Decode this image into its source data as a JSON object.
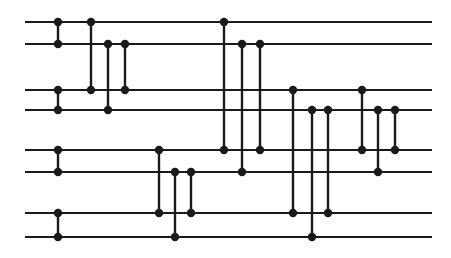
{
  "figure": {
    "type": "comparator-network",
    "width": 451,
    "height": 258,
    "background_color": "#ffffff",
    "ink_color": "#1a1a1a"
  },
  "chart_data": {
    "type": "diagram",
    "xlabel": "",
    "ylabel": "",
    "grid": false,
    "legend": null,
    "wire_count": 8,
    "wire_labels": [
      "1",
      "2",
      "3",
      "4",
      "5",
      "6",
      "7",
      "8"
    ],
    "wire_x_start": 25,
    "wire_x_end": 432,
    "wire_y": [
      22,
      44,
      90,
      110,
      150,
      172,
      213,
      237
    ],
    "node_radius": 4.2,
    "comparators": [
      {
        "x": 58,
        "top_wire": 0,
        "bottom_wire": 1
      },
      {
        "x": 58,
        "top_wire": 2,
        "bottom_wire": 3
      },
      {
        "x": 58,
        "top_wire": 4,
        "bottom_wire": 5
      },
      {
        "x": 58,
        "top_wire": 6,
        "bottom_wire": 7
      },
      {
        "x": 91,
        "top_wire": 0,
        "bottom_wire": 2
      },
      {
        "x": 108,
        "top_wire": 1,
        "bottom_wire": 3
      },
      {
        "x": 125,
        "top_wire": 1,
        "bottom_wire": 2
      },
      {
        "x": 159,
        "top_wire": 4,
        "bottom_wire": 6
      },
      {
        "x": 175,
        "top_wire": 5,
        "bottom_wire": 7
      },
      {
        "x": 191,
        "top_wire": 5,
        "bottom_wire": 6
      },
      {
        "x": 224,
        "top_wire": 0,
        "bottom_wire": 4
      },
      {
        "x": 242,
        "top_wire": 1,
        "bottom_wire": 5
      },
      {
        "x": 260,
        "top_wire": 1,
        "bottom_wire": 4
      },
      {
        "x": 293,
        "top_wire": 2,
        "bottom_wire": 6
      },
      {
        "x": 312,
        "top_wire": 3,
        "bottom_wire": 7
      },
      {
        "x": 328,
        "top_wire": 3,
        "bottom_wire": 6
      },
      {
        "x": 362,
        "top_wire": 2,
        "bottom_wire": 4
      },
      {
        "x": 378,
        "top_wire": 3,
        "bottom_wire": 5
      },
      {
        "x": 395,
        "top_wire": 3,
        "bottom_wire": 4
      }
    ]
  }
}
